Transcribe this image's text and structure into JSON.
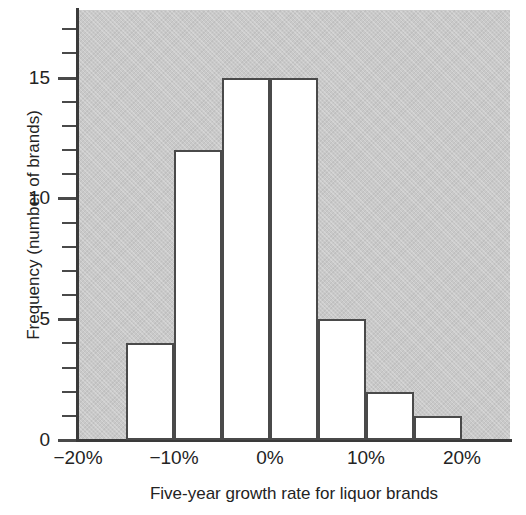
{
  "chart_data": {
    "type": "bar",
    "title": "",
    "subtitle": "",
    "xlabel": "Five-year growth rate for liquor brands",
    "ylabel": "Frequency (number of brands)",
    "categories": [
      "-15% to -10%",
      "-10% to -5%",
      "-5% to 0%",
      "0% to 5%",
      "5% to 10%",
      "10% to 15%",
      "15% to 20%"
    ],
    "bin_edges": [
      -15,
      -10,
      -5,
      0,
      5,
      10,
      15,
      20
    ],
    "bin_width": 5,
    "values": [
      4,
      12,
      15,
      15,
      5,
      2,
      1
    ],
    "xlim": [
      -20,
      25
    ],
    "ylim": [
      0,
      17.8
    ],
    "xtick_labels": [
      "−20%",
      "−10%",
      "0%",
      "10%",
      "20%"
    ],
    "xtick_values": [
      -20,
      -10,
      0,
      10,
      20
    ],
    "ytick_labels": [
      "0",
      "5",
      "10",
      "15"
    ],
    "ytick_values": [
      0,
      5,
      10,
      15
    ],
    "minor_ytick_step": 1,
    "grid": false,
    "legend": null,
    "plot_background_color": "#c9c9c9",
    "bar_fill_color": "#ffffff",
    "bar_edge_color": "#4a4a4a",
    "axis_color": "#3a3a3a",
    "text_color": "#232323"
  }
}
